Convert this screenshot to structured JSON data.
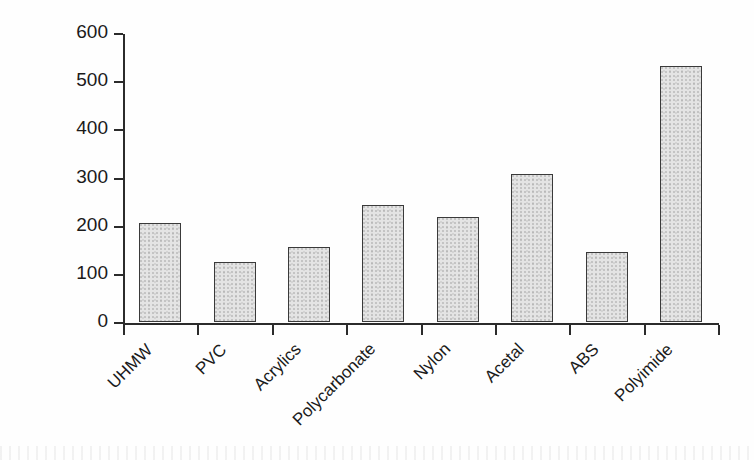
{
  "chart_data": {
    "type": "bar",
    "title": "",
    "xlabel": "",
    "ylabel": "Temperature (°F)",
    "ylabel_text": "Temperature (",
    "ylabel_unit": "°",
    "ylabel_tail": "F)",
    "categories": [
      "UHMW",
      "PVC",
      "Acrylics",
      "Polycarbonate",
      "Nylon",
      "Acetal",
      "ABS",
      "Polyimide"
    ],
    "values": [
      205,
      124,
      155,
      243,
      218,
      307,
      146,
      531
    ],
    "ylim": [
      0,
      600
    ],
    "yticks": [
      0,
      100,
      200,
      300,
      400,
      500,
      600
    ],
    "ytick_labels": [
      "0",
      "100",
      "200",
      "300",
      "400",
      "500",
      "600"
    ],
    "grid": false,
    "legend": false,
    "bar_fill": "#e4e4e4",
    "bar_edge": "#3a3a3a",
    "axis_color": "#2b2b2b"
  }
}
